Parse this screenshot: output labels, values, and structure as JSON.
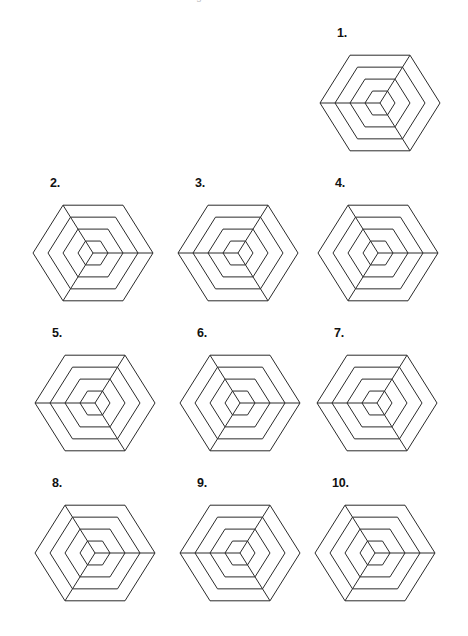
{
  "page": {
    "header_clipped_text": "Which of these figures is different from the others?",
    "background_color": "#ffffff",
    "stroke_color": "#2b2b2b",
    "label_color": "#111111",
    "width": 468,
    "height": 636
  },
  "figures": [
    {
      "label": "1.",
      "x": 315,
      "y": 26,
      "rings": 4,
      "spoke_vertices": [
        1,
        3,
        5
      ],
      "rotation_deg": 0
    },
    {
      "label": "2.",
      "x": 28,
      "y": 176,
      "rings": 4,
      "spoke_vertices": [
        0,
        2,
        4
      ],
      "rotation_deg": 0
    },
    {
      "label": "3.",
      "x": 173,
      "y": 176,
      "rings": 4,
      "spoke_vertices": [
        1,
        3,
        5
      ],
      "rotation_deg": 0
    },
    {
      "label": "4.",
      "x": 313,
      "y": 176,
      "rings": 4,
      "spoke_vertices": [
        0,
        2,
        4
      ],
      "rotation_deg": 0
    },
    {
      "label": "5.",
      "x": 30,
      "y": 326,
      "rings": 4,
      "spoke_vertices": [
        1,
        3,
        5
      ],
      "rotation_deg": 0
    },
    {
      "label": "6.",
      "x": 175,
      "y": 326,
      "rings": 4,
      "spoke_vertices": [
        0,
        2,
        4
      ],
      "rotation_deg": 0
    },
    {
      "label": "7.",
      "x": 312,
      "y": 326,
      "rings": 4,
      "spoke_vertices": [
        1,
        3,
        5
      ],
      "rotation_deg": 0
    },
    {
      "label": "8.",
      "x": 30,
      "y": 476,
      "rings": 4,
      "spoke_vertices": [
        0,
        2,
        4
      ],
      "rotation_deg": 0
    },
    {
      "label": "9.",
      "x": 175,
      "y": 476,
      "rings": 4,
      "spoke_vertices": [
        1,
        3,
        5
      ],
      "rotation_deg": 0
    },
    {
      "label": "10.",
      "x": 310,
      "y": 476,
      "rings": 4,
      "spoke_vertices": [
        0,
        2,
        4
      ],
      "rotation_deg": 0
    }
  ],
  "geometry": {
    "ring_radii": [
      60,
      45,
      30,
      15
    ],
    "center_x": 65,
    "center_y": 63,
    "hexagon_flat_side": "top-bottom",
    "vertex_angles_deg": [
      0,
      60,
      120,
      180,
      240,
      300
    ]
  }
}
